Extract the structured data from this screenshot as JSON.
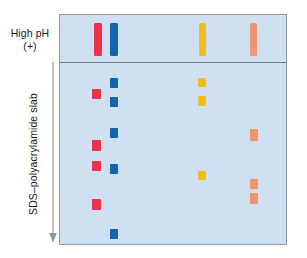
{
  "figure": {
    "name": "sds-polyacrylamide-gel-electrophoresis-diagram",
    "labels": {
      "high_ph": "High pH",
      "polarity": "(+)",
      "slab": "SDS–polyacrylamide slab"
    },
    "gel": {
      "background_color": "#cfe0f2",
      "border_color": "#8c9aa6",
      "divider_color": "#6f7d89",
      "x": 59,
      "y": 14,
      "width": 228,
      "height": 231,
      "divider_y": 47
    },
    "arrow": {
      "name": "direction-of-migration-arrow",
      "color": "#8e99a3",
      "direction": "down"
    }
  },
  "chart_data": {
    "type": "scatter",
    "xlabel": "",
    "ylabel": "",
    "annotations": [
      "High pH",
      "(+)",
      "SDS–polyacrylamide slab"
    ],
    "legend": null,
    "grid": false,
    "lanes": [
      {
        "name": "lane-red",
        "color": "#e8334a",
        "origin_band": {
          "x": 93,
          "y": 22,
          "width": 8,
          "height": 33
        },
        "bands": [
          {
            "x": 91,
            "y": 88,
            "width": 9,
            "height": 10
          },
          {
            "x": 91,
            "y": 139,
            "width": 9,
            "height": 11
          },
          {
            "x": 91,
            "y": 160,
            "width": 9,
            "height": 10
          },
          {
            "x": 91,
            "y": 198,
            "width": 9,
            "height": 11
          }
        ]
      },
      {
        "name": "lane-blue",
        "color": "#1464ab",
        "origin_band": {
          "x": 109,
          "y": 22,
          "width": 8,
          "height": 33
        },
        "bands": [
          {
            "x": 109,
            "y": 77,
            "width": 8,
            "height": 10
          },
          {
            "x": 109,
            "y": 96,
            "width": 8,
            "height": 10
          },
          {
            "x": 109,
            "y": 127,
            "width": 8,
            "height": 10
          },
          {
            "x": 109,
            "y": 163,
            "width": 8,
            "height": 10
          },
          {
            "x": 109,
            "y": 228,
            "width": 8,
            "height": 10
          }
        ]
      },
      {
        "name": "lane-yellow",
        "color": "#f2bc1b",
        "origin_band": {
          "x": 198,
          "y": 22,
          "width": 7,
          "height": 33
        },
        "bands": [
          {
            "x": 197,
            "y": 77,
            "width": 8,
            "height": 9
          },
          {
            "x": 197,
            "y": 95,
            "width": 8,
            "height": 10
          },
          {
            "x": 197,
            "y": 170,
            "width": 8,
            "height": 9
          }
        ]
      },
      {
        "name": "lane-orange",
        "color": "#f4956a",
        "origin_band": {
          "x": 249,
          "y": 22,
          "width": 7,
          "height": 33
        },
        "bands": [
          {
            "x": 249,
            "y": 128,
            "width": 8,
            "height": 12
          },
          {
            "x": 249,
            "y": 178,
            "width": 8,
            "height": 10
          },
          {
            "x": 249,
            "y": 192,
            "width": 8,
            "height": 11
          }
        ]
      }
    ]
  }
}
